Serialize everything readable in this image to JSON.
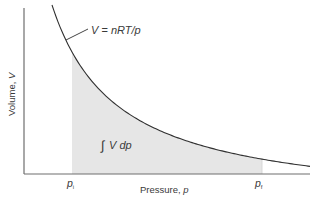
{
  "diagram": {
    "title": "",
    "curve_label": "V = nRT/p",
    "curve_label_parts": {
      "lhs": "V",
      "eq": " = ",
      "rhs": "nRT/p"
    },
    "area_label": {
      "integral": "∫",
      "text": "V dp"
    },
    "x_axis_label": {
      "text": "Pressure, ",
      "var": "p"
    },
    "y_axis_label": {
      "text": "Volume, ",
      "var": "V"
    },
    "p_initial": {
      "var": "p",
      "sub": "i"
    },
    "p_final": {
      "var": "p",
      "sub": "f"
    },
    "colors": {
      "axis": "#6e6e6e",
      "curve": "#2f2f2f",
      "shade": "#e6e6e6",
      "text": "#3a3a3a"
    }
  },
  "chart_data": {
    "type": "area",
    "title": "",
    "xlabel": "Pressure, p",
    "ylabel": "Volume, V",
    "curve": "V = nRT/p (isotherm, hyperbola)",
    "shaded_region": {
      "from": "p_i",
      "to": "p_f",
      "label": "∫V dp"
    },
    "tick_labels": [
      "p_i",
      "p_f"
    ],
    "grid": false,
    "legend": "none",
    "pixel_fit": {
      "x0": -14.3,
      "d": 13446,
      "B": 207.8,
      "x_start": 52,
      "x_end": 310,
      "shade_from": 72,
      "shade_to": 262,
      "axis_y": 174,
      "axis_x": 24
    }
  }
}
